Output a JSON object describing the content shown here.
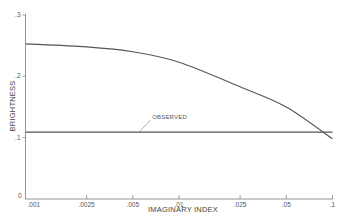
{
  "chart_data": {
    "type": "line",
    "title": "",
    "xlabel": "IMAGINARY INDEX",
    "ylabel": "BRIGHTNESS",
    "xscale": "log",
    "xlim": [
      0.001,
      0.1
    ],
    "ylim": [
      0,
      0.3
    ],
    "grid": false,
    "legend": null,
    "x_ticks": [
      0.001,
      0.0025,
      0.005,
      0.01,
      0.025,
      0.05,
      0.1
    ],
    "x_tick_labels": [
      ".001",
      ".0025",
      ".005",
      ".01",
      ".025",
      ".05",
      ".1"
    ],
    "y_ticks": [
      0,
      0.1,
      0.2,
      0.3
    ],
    "y_tick_labels": [
      "0",
      ".1",
      ".2",
      ".3"
    ],
    "series": [
      {
        "name": "computed",
        "x": [
          0.001,
          0.0025,
          0.005,
          0.01,
          0.025,
          0.05,
          0.1
        ],
        "values": [
          0.253,
          0.248,
          0.24,
          0.223,
          0.183,
          0.15,
          0.098
        ]
      },
      {
        "name": "OBSERVED",
        "x": [
          0.001,
          0.1
        ],
        "values": [
          0.109,
          0.109
        ]
      }
    ],
    "annotations": [
      {
        "text": "OBSERVED",
        "target_series": "OBSERVED",
        "x": 0.0055,
        "y": 0.109
      }
    ]
  },
  "colors": {
    "line": "#555555",
    "axis": "#777777",
    "text": "#555555"
  }
}
